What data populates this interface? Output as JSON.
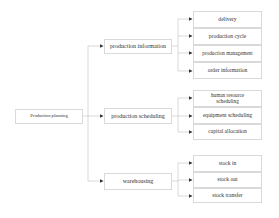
{
  "diagram": {
    "type": "tree",
    "root": {
      "label": "Production planning"
    },
    "branches": [
      {
        "label": "production information",
        "children": [
          {
            "label": "delivery"
          },
          {
            "label": "production cycle"
          },
          {
            "label": "production management"
          },
          {
            "label": "order information"
          }
        ]
      },
      {
        "label": "production scheduling",
        "children": [
          {
            "label": "human resource scheduling"
          },
          {
            "label": "equipment scheduling"
          },
          {
            "label": "capital allocation"
          }
        ]
      },
      {
        "label": "warehousing",
        "children": [
          {
            "label": "stock in"
          },
          {
            "label": "stock out"
          },
          {
            "label": "stock transfer"
          }
        ]
      }
    ],
    "colors": {
      "border": "#d9d9d9",
      "line": "#bfbfbf",
      "arrow": "#333333",
      "text": "#333333"
    }
  }
}
